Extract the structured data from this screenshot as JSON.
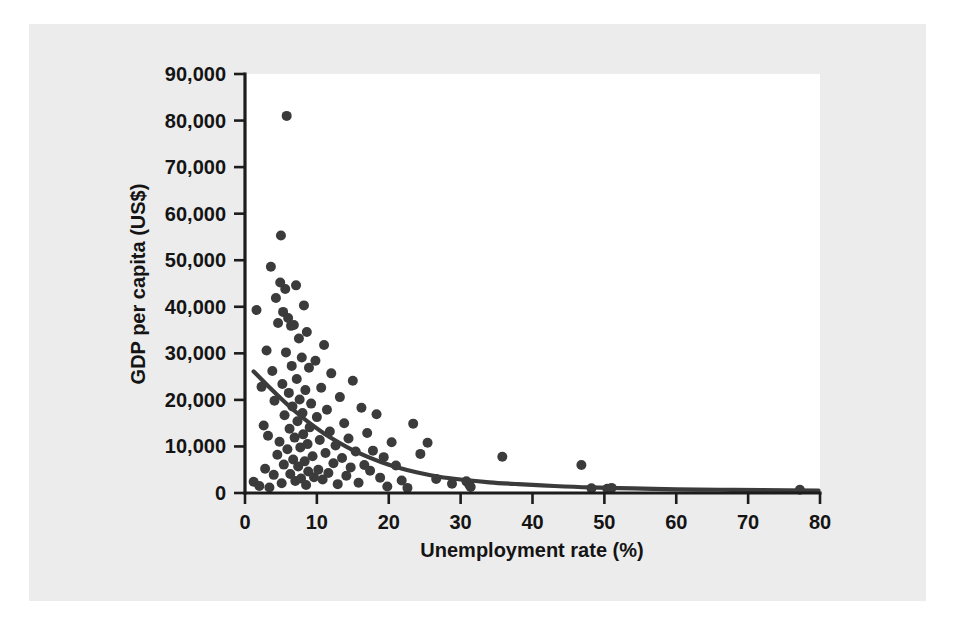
{
  "figure": {
    "background_color": "#ffffff",
    "panel_color": "#ececec",
    "plot_area_color": "#ffffff",
    "ink_color": "#3b3b3b",
    "axis_color": "#1c1c1c"
  },
  "chart_data": {
    "type": "scatter",
    "title": "",
    "subtitle": "",
    "xlabel": "Unemployment rate (%)",
    "ylabel": "GDP per capita (US$)",
    "xlim": [
      0,
      80
    ],
    "ylim": [
      0,
      90000
    ],
    "xticks": [
      0,
      10,
      20,
      30,
      40,
      50,
      60,
      70,
      80
    ],
    "xtick_labels": [
      "0",
      "10",
      "20",
      "30",
      "40",
      "50",
      "60",
      "70",
      "80"
    ],
    "yticks": [
      0,
      10000,
      20000,
      30000,
      40000,
      50000,
      60000,
      70000,
      80000,
      90000
    ],
    "ytick_labels": [
      "0",
      "10,000",
      "20,000",
      "30,000",
      "40,000",
      "50,000",
      "60,000",
      "70,000",
      "80,000",
      "90,000"
    ],
    "grid": false,
    "legend": null,
    "legend_position": "none",
    "marker_color": "#3b3b3b",
    "marker_size": 5,
    "annotations": [],
    "series": [
      {
        "name": "Countries",
        "type": "scatter",
        "marker_color": "#3b3b3b",
        "points": [
          [
            1.2,
            2400
          ],
          [
            1.6,
            39300
          ],
          [
            2.0,
            1500
          ],
          [
            2.3,
            22800
          ],
          [
            2.6,
            14500
          ],
          [
            2.8,
            5200
          ],
          [
            3.0,
            30600
          ],
          [
            3.2,
            12300
          ],
          [
            3.4,
            1200
          ],
          [
            3.6,
            48600
          ],
          [
            3.8,
            26200
          ],
          [
            4.0,
            3900
          ],
          [
            4.1,
            19800
          ],
          [
            4.3,
            41900
          ],
          [
            4.5,
            8200
          ],
          [
            4.6,
            36500
          ],
          [
            4.8,
            11000
          ],
          [
            4.9,
            45200
          ],
          [
            5.0,
            55300
          ],
          [
            5.1,
            2100
          ],
          [
            5.2,
            23400
          ],
          [
            5.3,
            38900
          ],
          [
            5.4,
            6100
          ],
          [
            5.5,
            16700
          ],
          [
            5.6,
            43800
          ],
          [
            5.7,
            30200
          ],
          [
            5.8,
            81000
          ],
          [
            5.9,
            9400
          ],
          [
            6.0,
            37600
          ],
          [
            6.1,
            21500
          ],
          [
            6.2,
            13800
          ],
          [
            6.3,
            4100
          ],
          [
            6.4,
            35900
          ],
          [
            6.5,
            27300
          ],
          [
            6.6,
            18600
          ],
          [
            6.7,
            7200
          ],
          [
            6.8,
            36100
          ],
          [
            6.9,
            11900
          ],
          [
            7.0,
            2600
          ],
          [
            7.1,
            44600
          ],
          [
            7.2,
            24500
          ],
          [
            7.3,
            15400
          ],
          [
            7.4,
            5700
          ],
          [
            7.5,
            33200
          ],
          [
            7.6,
            20100
          ],
          [
            7.7,
            9800
          ],
          [
            7.8,
            3100
          ],
          [
            7.9,
            29100
          ],
          [
            8.0,
            17200
          ],
          [
            8.1,
            12600
          ],
          [
            8.2,
            40300
          ],
          [
            8.3,
            6800
          ],
          [
            8.4,
            22100
          ],
          [
            8.5,
            1700
          ],
          [
            8.6,
            34600
          ],
          [
            8.7,
            10500
          ],
          [
            8.8,
            4600
          ],
          [
            8.9,
            26900
          ],
          [
            9.0,
            14100
          ],
          [
            9.2,
            19200
          ],
          [
            9.4,
            7900
          ],
          [
            9.6,
            3400
          ],
          [
            9.8,
            28400
          ],
          [
            10.0,
            16300
          ],
          [
            10.2,
            5000
          ],
          [
            10.4,
            11400
          ],
          [
            10.6,
            22600
          ],
          [
            10.8,
            2900
          ],
          [
            11.0,
            31800
          ],
          [
            11.2,
            8600
          ],
          [
            11.4,
            17900
          ],
          [
            11.6,
            4300
          ],
          [
            11.8,
            13200
          ],
          [
            12.0,
            25700
          ],
          [
            12.3,
            6400
          ],
          [
            12.6,
            10200
          ],
          [
            12.9,
            1900
          ],
          [
            13.2,
            20600
          ],
          [
            13.5,
            7500
          ],
          [
            13.8,
            15000
          ],
          [
            14.1,
            3700
          ],
          [
            14.4,
            11700
          ],
          [
            14.7,
            5500
          ],
          [
            15.0,
            24100
          ],
          [
            15.4,
            8900
          ],
          [
            15.8,
            2200
          ],
          [
            16.2,
            18300
          ],
          [
            16.6,
            6000
          ],
          [
            17.0,
            12900
          ],
          [
            17.4,
            4800
          ],
          [
            17.8,
            9100
          ],
          [
            18.3,
            16900
          ],
          [
            18.8,
            3300
          ],
          [
            19.3,
            7700
          ],
          [
            19.8,
            1400
          ],
          [
            20.4,
            10900
          ],
          [
            21.0,
            5900
          ],
          [
            21.8,
            2700
          ],
          [
            22.6,
            1100
          ],
          [
            23.4,
            14900
          ],
          [
            24.4,
            8400
          ],
          [
            25.4,
            10800
          ],
          [
            26.6,
            3000
          ],
          [
            28.8,
            2000
          ],
          [
            30.8,
            2500
          ],
          [
            31.2,
            1800
          ],
          [
            31.4,
            1300
          ],
          [
            35.8,
            7800
          ],
          [
            46.8,
            6000
          ],
          [
            48.2,
            1000
          ],
          [
            50.4,
            900
          ],
          [
            51.0,
            1100
          ],
          [
            77.2,
            700
          ]
        ]
      },
      {
        "name": "Fitted trend",
        "type": "line",
        "line_color": "#3b3b3b",
        "points": [
          [
            1.2,
            26100
          ],
          [
            3,
            23300
          ],
          [
            5,
            20300
          ],
          [
            7,
            17500
          ],
          [
            9,
            15000
          ],
          [
            11,
            12800
          ],
          [
            13,
            10900
          ],
          [
            15,
            9200
          ],
          [
            17,
            7800
          ],
          [
            19,
            6600
          ],
          [
            21,
            5600
          ],
          [
            24,
            4400
          ],
          [
            27,
            3500
          ],
          [
            30,
            2900
          ],
          [
            34,
            2300
          ],
          [
            38,
            1900
          ],
          [
            43,
            1500
          ],
          [
            48,
            1200
          ],
          [
            54,
            1000
          ],
          [
            60,
            800
          ],
          [
            66,
            700
          ],
          [
            72,
            600
          ],
          [
            79.8,
            500
          ]
        ]
      }
    ]
  }
}
